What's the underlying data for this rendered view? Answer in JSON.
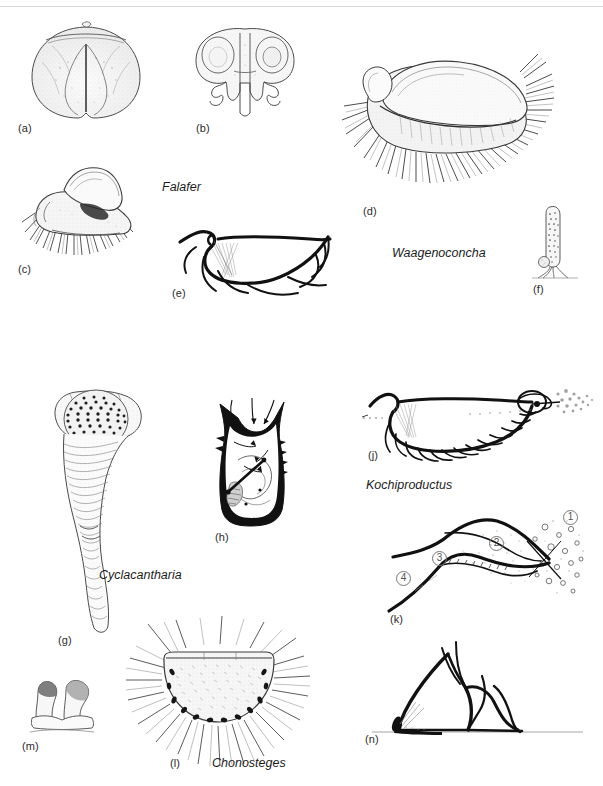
{
  "plate": {
    "width": 603,
    "height": 786,
    "background": "#ffffff",
    "ink": "#1a1a1a",
    "rule_color": "#d8d8d8"
  },
  "panels": [
    {
      "id": "a",
      "label": "(a)",
      "x": 18,
      "y": 122,
      "subject": "rounded-shell-dorsal-view"
    },
    {
      "id": "b",
      "label": "(b)",
      "x": 196,
      "y": 122,
      "subject": "bilobed-shell-anterior-view"
    },
    {
      "id": "c",
      "label": "(c)",
      "x": 18,
      "y": 263,
      "subject": "spinose-shell-oblique-view"
    },
    {
      "id": "d",
      "label": "(d)",
      "x": 363,
      "y": 205,
      "subject": "waagenoconcha-spinose-shell"
    },
    {
      "id": "e",
      "label": "(e)",
      "x": 172,
      "y": 287,
      "subject": "shell-section-with-spines"
    },
    {
      "id": "f",
      "label": "(f)",
      "x": 533,
      "y": 283,
      "subject": "elongate-shell-with-rootlets"
    },
    {
      "id": "g",
      "label": "(g)",
      "x": 58,
      "y": 634,
      "subject": "cyclacantharia-conical-shell"
    },
    {
      "id": "h",
      "label": "(h)",
      "x": 215,
      "y": 531,
      "subject": "interior-view-with-flow-arrows"
    },
    {
      "id": "j",
      "label": "(j)",
      "x": 368,
      "y": 449,
      "subject": "kochiproductus-section-with-current"
    },
    {
      "id": "k",
      "label": "(k)",
      "x": 390,
      "y": 613,
      "subject": "feeding-current-diagram"
    },
    {
      "id": "l",
      "label": "(l)",
      "x": 170,
      "y": 757,
      "subject": "chonosteges-spinose-shell"
    },
    {
      "id": "m",
      "label": "(m)",
      "x": 22,
      "y": 740,
      "subject": "paired-attachment-structures"
    },
    {
      "id": "n",
      "label": "(n)",
      "x": 365,
      "y": 733,
      "subject": "life-position-section-on-substrate"
    }
  ],
  "taxa": [
    {
      "name": "Falafer",
      "x": 162,
      "y": 180
    },
    {
      "name": "Waagenoconcha",
      "x": 392,
      "y": 246
    },
    {
      "name": "Cyclacantharia",
      "x": 99,
      "y": 568
    },
    {
      "name": "Kochiproductus",
      "x": 366,
      "y": 478
    },
    {
      "name": "Chonosteges",
      "x": 212,
      "y": 756
    }
  ],
  "callouts": [
    {
      "text": "1",
      "x": 563,
      "y": 510
    },
    {
      "text": "2",
      "x": 489,
      "y": 536
    },
    {
      "text": "3",
      "x": 432,
      "y": 551
    },
    {
      "text": "4",
      "x": 396,
      "y": 571
    }
  ]
}
